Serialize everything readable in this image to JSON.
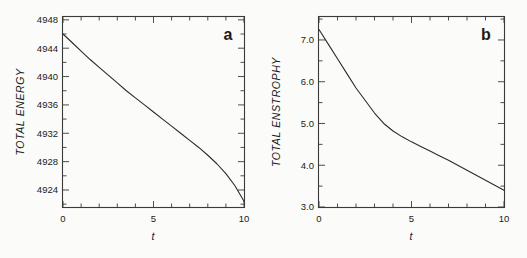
{
  "figure": {
    "background_color": "#fbfbf9",
    "ink_color": "#2b2b2b"
  },
  "panels": [
    {
      "letter": "a",
      "ylabel": "TOTAL  ENERGY",
      "xlabel": "t",
      "ytick_labels": [
        "4924",
        "4928",
        "4932",
        "4936",
        "4940",
        "4944",
        "4948"
      ],
      "xtick_labels": [
        "0",
        "5",
        "10"
      ]
    },
    {
      "letter": "b",
      "ylabel": "TOTAL  ENSTROPHY",
      "xlabel": "t",
      "ytick_labels": [
        "3.0",
        "4.0",
        "5.0",
        "6.0",
        "7.0"
      ],
      "xtick_labels": [
        "0",
        "5",
        "10"
      ]
    }
  ],
  "chart_data": [
    {
      "type": "line",
      "title": "a",
      "xlabel": "t",
      "ylabel": "TOTAL ENERGY",
      "xlim": [
        0,
        10
      ],
      "ylim": [
        4921.6,
        4948.4
      ],
      "grid": false,
      "legend": "none",
      "xticks": [
        0,
        5,
        10
      ],
      "xticks_minor_step": 1,
      "yticks": [
        4924,
        4928,
        4932,
        4936,
        4940,
        4944,
        4948
      ],
      "yticks_minor_step": 2,
      "x": [
        0,
        0.5,
        1,
        1.5,
        2,
        2.5,
        3,
        3.5,
        4,
        4.5,
        5,
        5.5,
        6,
        6.5,
        7,
        7.5,
        8,
        8.5,
        9,
        9.5,
        10
      ],
      "y": [
        4946.0,
        4944.8,
        4943.6,
        4942.4,
        4941.3,
        4940.2,
        4939.1,
        4938.0,
        4937.0,
        4936.0,
        4935.0,
        4934.0,
        4933.0,
        4932.0,
        4931.0,
        4930.0,
        4928.9,
        4927.7,
        4926.3,
        4924.6,
        4922.4
      ]
    },
    {
      "type": "line",
      "title": "b",
      "xlabel": "t",
      "ylabel": "TOTAL ENSTROPHY",
      "xlim": [
        0,
        10
      ],
      "ylim": [
        3.0,
        7.55
      ],
      "grid": false,
      "legend": "none",
      "xticks": [
        0,
        5,
        10
      ],
      "xticks_minor_step": 1,
      "yticks": [
        3.0,
        4.0,
        5.0,
        6.0,
        7.0
      ],
      "yticks_minor_step": 0.5,
      "x": [
        0,
        0.5,
        1,
        1.5,
        2,
        2.5,
        3,
        3.5,
        4,
        4.5,
        5,
        5.5,
        6,
        6.5,
        7,
        7.5,
        8,
        8.5,
        9,
        9.5,
        10
      ],
      "y": [
        7.25,
        6.9,
        6.55,
        6.2,
        5.85,
        5.55,
        5.25,
        5.0,
        4.82,
        4.68,
        4.56,
        4.45,
        4.34,
        4.23,
        4.12,
        4.0,
        3.88,
        3.76,
        3.64,
        3.52,
        3.4
      ]
    }
  ]
}
